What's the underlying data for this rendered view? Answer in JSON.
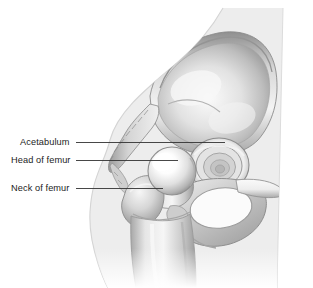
{
  "figure": {
    "width": 313,
    "height": 288,
    "background_color": "#ffffff",
    "body_silhouette_color": "#ededed",
    "bone_light_color": "#f2f2f2",
    "bone_mid_color": "#b9b9b9",
    "bone_dark_color": "#8e8e8e",
    "leader_line_color": "#333333",
    "label_text_color": "#1c1c1c"
  },
  "labels": [
    {
      "id": "acetabulum",
      "text": "Acetabulum",
      "text_x": 20,
      "text_y": 142,
      "leader_from_x": 76,
      "leader_to_x": 225,
      "leader_y": 142
    },
    {
      "id": "head-of-femur",
      "text": "Head of femur",
      "text_x": 11,
      "text_y": 160,
      "leader_from_x": 76,
      "leader_to_x": 178,
      "leader_y": 160
    },
    {
      "id": "neck-of-femur",
      "text": "Neck of femur",
      "text_x": 11,
      "text_y": 188,
      "leader_from_x": 76,
      "leader_to_x": 163,
      "leader_y": 188
    }
  ],
  "anatomy_parts": [
    "body-silhouette",
    "ilium",
    "iliac-crest",
    "anterior-superior-iliac-spine",
    "acetabulum",
    "femoral-head",
    "femoral-neck",
    "greater-trochanter",
    "lesser-trochanter",
    "femur-shaft",
    "pubis",
    "ischium",
    "obturator-foramen"
  ]
}
